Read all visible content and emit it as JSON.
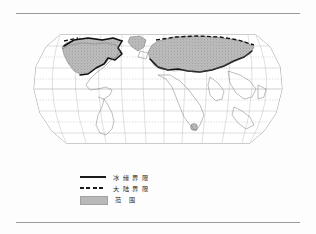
{
  "figure": {
    "title": "",
    "map": {
      "projection_name": "robinson-world",
      "graticule": {
        "parallels": [
          75,
          60,
          45,
          30,
          15,
          0,
          -15,
          -30,
          -45,
          -60
        ],
        "meridians": [
          -180,
          -150,
          -120,
          -90,
          -60,
          -30,
          0,
          30,
          60,
          90,
          120,
          150,
          180
        ],
        "equator": 0,
        "grid_visible": true
      },
      "features": [
        {
          "name": "north-america-glaciation",
          "fill": "stipple-gray"
        },
        {
          "name": "eurasia-glaciation",
          "fill": "stipple-gray"
        },
        {
          "name": "greenland-ice",
          "fill": "stipple-gray"
        },
        {
          "name": "kilimanjaro-glacier-marker",
          "fill": "stipple-gray"
        }
      ]
    },
    "legend": {
      "items": [
        {
          "symbol": "solid-line",
          "label": "冰 缘 界 限"
        },
        {
          "symbol": "dashed-line",
          "label": "大 陆 界 限"
        },
        {
          "symbol": "stipple-fill",
          "label": "范  围"
        }
      ]
    }
  },
  "rules": {
    "top": "horizontal-rule",
    "bottom": "horizontal-rule"
  },
  "colors": {
    "ink": "#1a1a1a",
    "rule": "#9a9a9a",
    "coastline": "#5a5a5a",
    "graticule": "#9e9e9e",
    "ice_fill": "#b5b5b5",
    "page": "#fdfdfd"
  }
}
